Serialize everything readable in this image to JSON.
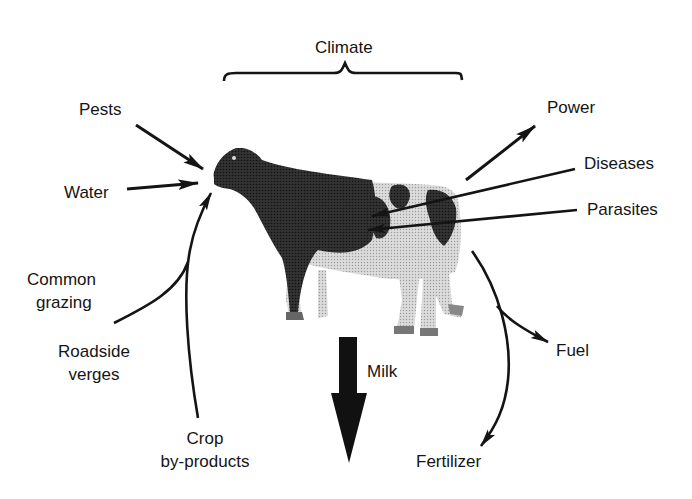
{
  "diagram": {
    "type": "input-output diagram",
    "center": {
      "subject": "cow",
      "icon": "cow-illustration"
    },
    "top_label": "Climate",
    "inputs": [
      {
        "label": "Pests"
      },
      {
        "label": "Water"
      },
      {
        "label": "Common\ngrazing",
        "lines": [
          "Common",
          "grazing"
        ]
      },
      {
        "label": "Roadside\nverges",
        "lines": [
          "Roadside",
          "verges"
        ]
      },
      {
        "label": "Crop\nby-products",
        "lines": [
          "Crop",
          "by-products"
        ]
      }
    ],
    "health_factors": [
      {
        "label": "Diseases"
      },
      {
        "label": "Parasites"
      }
    ],
    "outputs": [
      {
        "label": "Power"
      },
      {
        "label": "Milk"
      },
      {
        "label": "Fuel"
      },
      {
        "label": "Fertilizer"
      }
    ],
    "colors": {
      "ink": "#141414",
      "background": "#ffffff",
      "cow_dark": "#2a2a2a",
      "cow_light": "#e6e6e6"
    }
  }
}
